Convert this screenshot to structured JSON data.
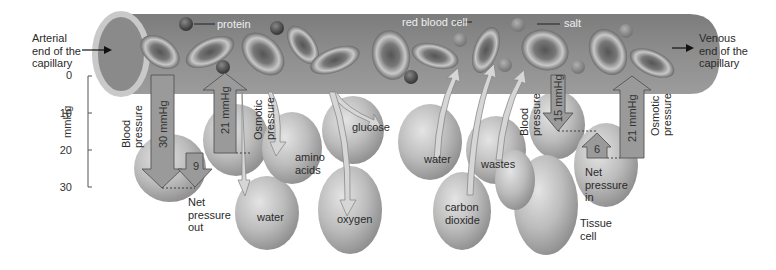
{
  "diagram": {
    "ends": {
      "arterial": [
        "Arterial",
        "end of the",
        "capillary"
      ],
      "venous": [
        "Venous",
        "end of the",
        "capillary"
      ]
    },
    "capillary_labels": {
      "protein": "protein",
      "red_blood_cell": "red blood cell",
      "salt": "salt"
    },
    "axis": {
      "unit": "mmHg",
      "ticks": [
        "0",
        "10",
        "20",
        "30"
      ]
    },
    "arterial_side": {
      "blood_pressure_label": [
        "Blood",
        "pressure"
      ],
      "blood_pressure_value": "30 mmHg",
      "osmotic_pressure_label": [
        "Osmotic",
        "pressure"
      ],
      "osmotic_pressure_value": "21 mmHg",
      "net_value": "9",
      "net_label": [
        "Net",
        "pressure",
        "out"
      ]
    },
    "venous_side": {
      "blood_pressure_label": [
        "Blood",
        "pressure"
      ],
      "blood_pressure_value": "15 mmHg",
      "osmotic_pressure_label": [
        "Osmotic",
        "pressure"
      ],
      "osmotic_pressure_value": "21 mmHg",
      "net_value": "6",
      "net_label": [
        "Net",
        "pressure",
        "in"
      ]
    },
    "substances_out": [
      "water",
      "amino acids",
      "glucose",
      "oxygen"
    ],
    "substances_in": [
      "water",
      "carbon dioxide",
      "wastes"
    ],
    "substance_labels": {
      "water_out": "water",
      "amino": [
        "amino",
        "acids"
      ],
      "glucose": "glucose",
      "oxygen": "oxygen",
      "water_in": "water",
      "carbon": [
        "carbon",
        "dioxide"
      ],
      "wastes": "wastes"
    },
    "tissue_cell_label": [
      "Tissue",
      "cell"
    ],
    "colors": {
      "capillary": "#8a8a8a",
      "arrow_fill": "#9a9a9a",
      "cell_fill": "#bdbdbd",
      "rbc": "#7a7a7a"
    }
  }
}
